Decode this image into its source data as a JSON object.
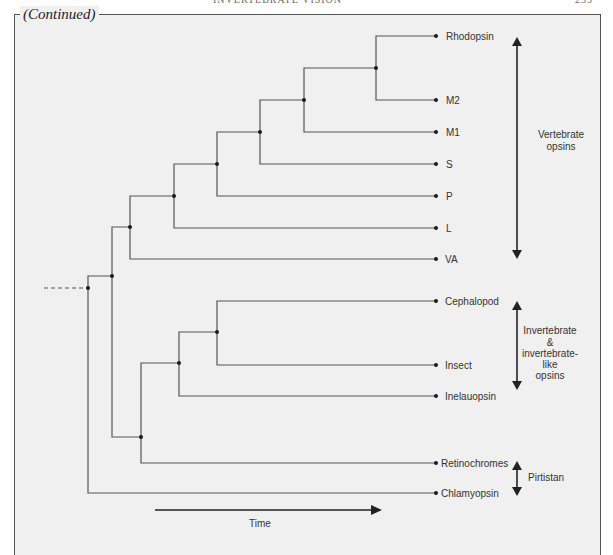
{
  "page": {
    "running_head": "INVERTEBRATE VISION",
    "page_number": "233"
  },
  "figure": {
    "continued_label": "(Continued)",
    "leaves": [
      {
        "label": "Rhodopsin",
        "y": 36
      },
      {
        "label": "M2",
        "y": 100
      },
      {
        "label": "M1",
        "y": 132
      },
      {
        "label": "S",
        "y": 164
      },
      {
        "label": "P",
        "y": 196
      },
      {
        "label": "L",
        "y": 228
      },
      {
        "label": "VA",
        "y": 259
      },
      {
        "label": "Cephalopod",
        "y": 301
      },
      {
        "label": "Insect",
        "y": 365
      },
      {
        "label": "Inelauopsin",
        "y": 396
      },
      {
        "label": "Retinochromes",
        "y": 463
      },
      {
        "label": "Chlamyopsin",
        "y": 493
      }
    ],
    "groups": [
      {
        "label_lines": [
          "Vertebrate",
          "opsins"
        ]
      },
      {
        "label_lines": [
          "Invertebrate",
          "&",
          "invertebrate-",
          "like",
          "opsins"
        ]
      },
      {
        "label_lines": [
          "Pirtistan"
        ]
      }
    ],
    "time_axis": {
      "label": "Time"
    },
    "colors": {
      "line": "#555555",
      "node": "#1a1a1a",
      "arrow": "#222222",
      "panel_bg": "#f0f0f0",
      "text": "#333333"
    }
  }
}
